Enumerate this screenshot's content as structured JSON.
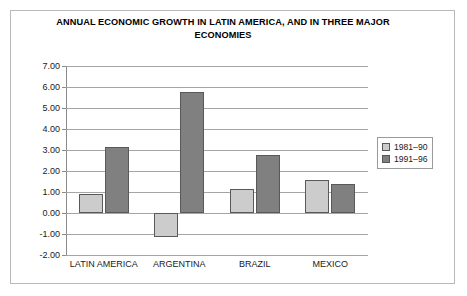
{
  "chart_data": {
    "type": "bar",
    "title": "ANNUAL ECONOMIC GROWTH IN LATIN AMERICA, AND IN THREE MAJOR ECONOMIES",
    "xlabel": "",
    "ylabel": "",
    "categories": [
      "LATIN AMERICA",
      "ARGENTINA",
      "BRAZIL",
      "MEXICO"
    ],
    "series": [
      {
        "name": "1981–90",
        "color": "#cccccc",
        "values": [
          0.9,
          -1.15,
          1.15,
          1.55
        ]
      },
      {
        "name": "1991–96",
        "color": "#808080",
        "values": [
          3.15,
          5.75,
          2.75,
          1.4
        ]
      }
    ],
    "ylim": [
      -2.0,
      7.0
    ],
    "ytick_labels": [
      "7.00",
      "6.00",
      "5.00",
      "4.00",
      "3.00",
      "2.00",
      "1.00",
      "0.00",
      "-1.00",
      "-2.00"
    ],
    "ytick_values": [
      7.0,
      6.0,
      5.0,
      4.0,
      3.0,
      2.0,
      1.0,
      0.0,
      -1.0,
      -2.0
    ],
    "grid": true,
    "legend_position": "right",
    "bar_border_color": "#595959",
    "gridline_color": "#a5a5a5",
    "frame_color": "#b9b9b9",
    "background": "#ffffff"
  }
}
